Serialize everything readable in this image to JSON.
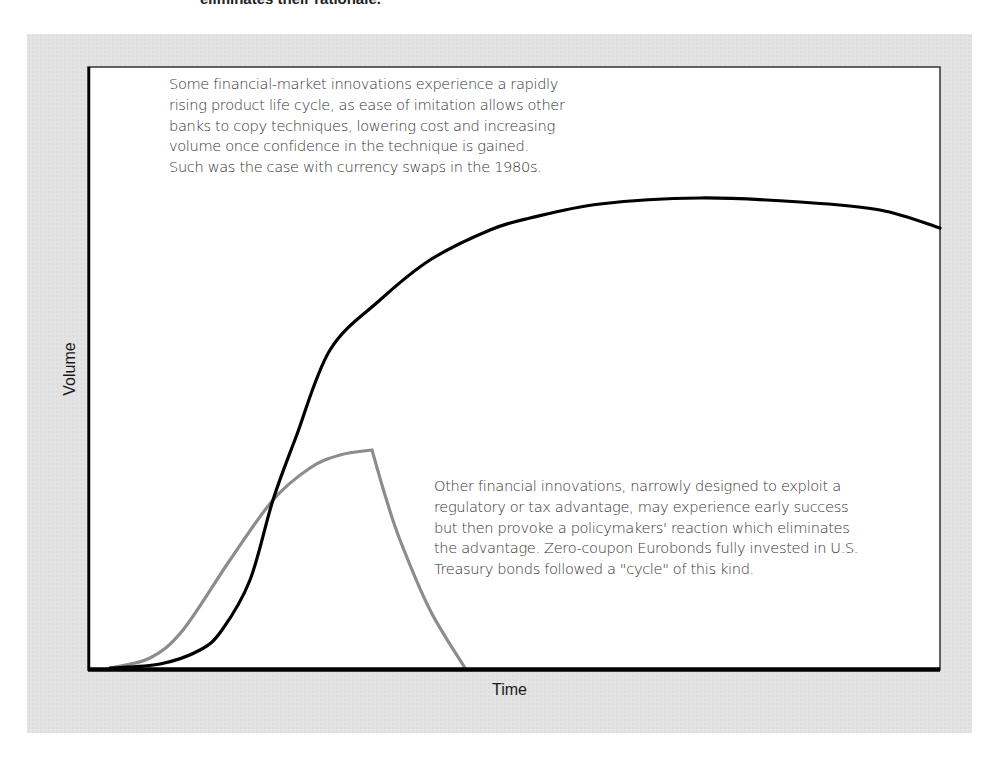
{
  "page": {
    "top_cut_text": "eliminates their rationale."
  },
  "chart_data": {
    "type": "line",
    "title": "",
    "xlabel": "Time",
    "ylabel": "Volume",
    "grid": false,
    "legend": null,
    "axis_ticks": "none (conceptual diagram, unlabeled axes)",
    "x_range_px": [
      88,
      940
    ],
    "y_baseline_px": 669,
    "series": [
      {
        "name": "Rapidly rising product life cycle (e.g. currency swaps, 1980s)",
        "color": "#000000",
        "style": "solid thick",
        "points_px": [
          [
            110,
            668
          ],
          [
            160,
            664
          ],
          [
            200,
            650
          ],
          [
            222,
            630
          ],
          [
            250,
            580
          ],
          [
            273,
            500
          ],
          [
            296,
            437
          ],
          [
            330,
            350
          ],
          [
            380,
            300
          ],
          [
            430,
            260
          ],
          [
            490,
            230
          ],
          [
            530,
            218
          ],
          [
            600,
            204
          ],
          [
            700,
            198
          ],
          [
            800,
            202
          ],
          [
            880,
            210
          ],
          [
            940,
            228
          ]
        ]
      },
      {
        "name": "Regulatory/tax-advantage innovation (e.g. zero-coupon Eurobonds)",
        "color": "#8c8c8c",
        "style": "solid thick",
        "points_px": [
          [
            110,
            668
          ],
          [
            150,
            658
          ],
          [
            183,
            630
          ],
          [
            230,
            560
          ],
          [
            273,
            500
          ],
          [
            310,
            468
          ],
          [
            340,
            455
          ],
          [
            372,
            450
          ],
          [
            385,
            495
          ],
          [
            400,
            540
          ],
          [
            430,
            610
          ],
          [
            465,
            668
          ]
        ]
      }
    ],
    "annotations": [
      {
        "id": "annotation-rapid",
        "lines": [
          "Some financial-market innovations experience a rapidly",
          "rising product life cycle, as ease of imitation allows other",
          "banks to copy techniques, lowering cost and increasing",
          "volume once confidence in the technique is gained.",
          "Such was the case with currency swaps in the 1980s."
        ]
      },
      {
        "id": "annotation-regulatory",
        "lines": [
          "Other financial innovations, narrowly designed to exploit a",
          "regulatory or tax advantage, may experience early success",
          "but then provoke a policymakers' reaction which eliminates",
          "the advantage. Zero-coupon Eurobonds fully invested in U.S.",
          "Treasury bonds followed a \"cycle\" of this kind."
        ]
      }
    ]
  },
  "colors": {
    "panel_background": "#e3e3e3",
    "plot_background": "#ffffff",
    "axis": "#000000",
    "series_rapid": "#000000",
    "series_regulatory": "#8c8c8c",
    "annotation_text": "#333333"
  }
}
